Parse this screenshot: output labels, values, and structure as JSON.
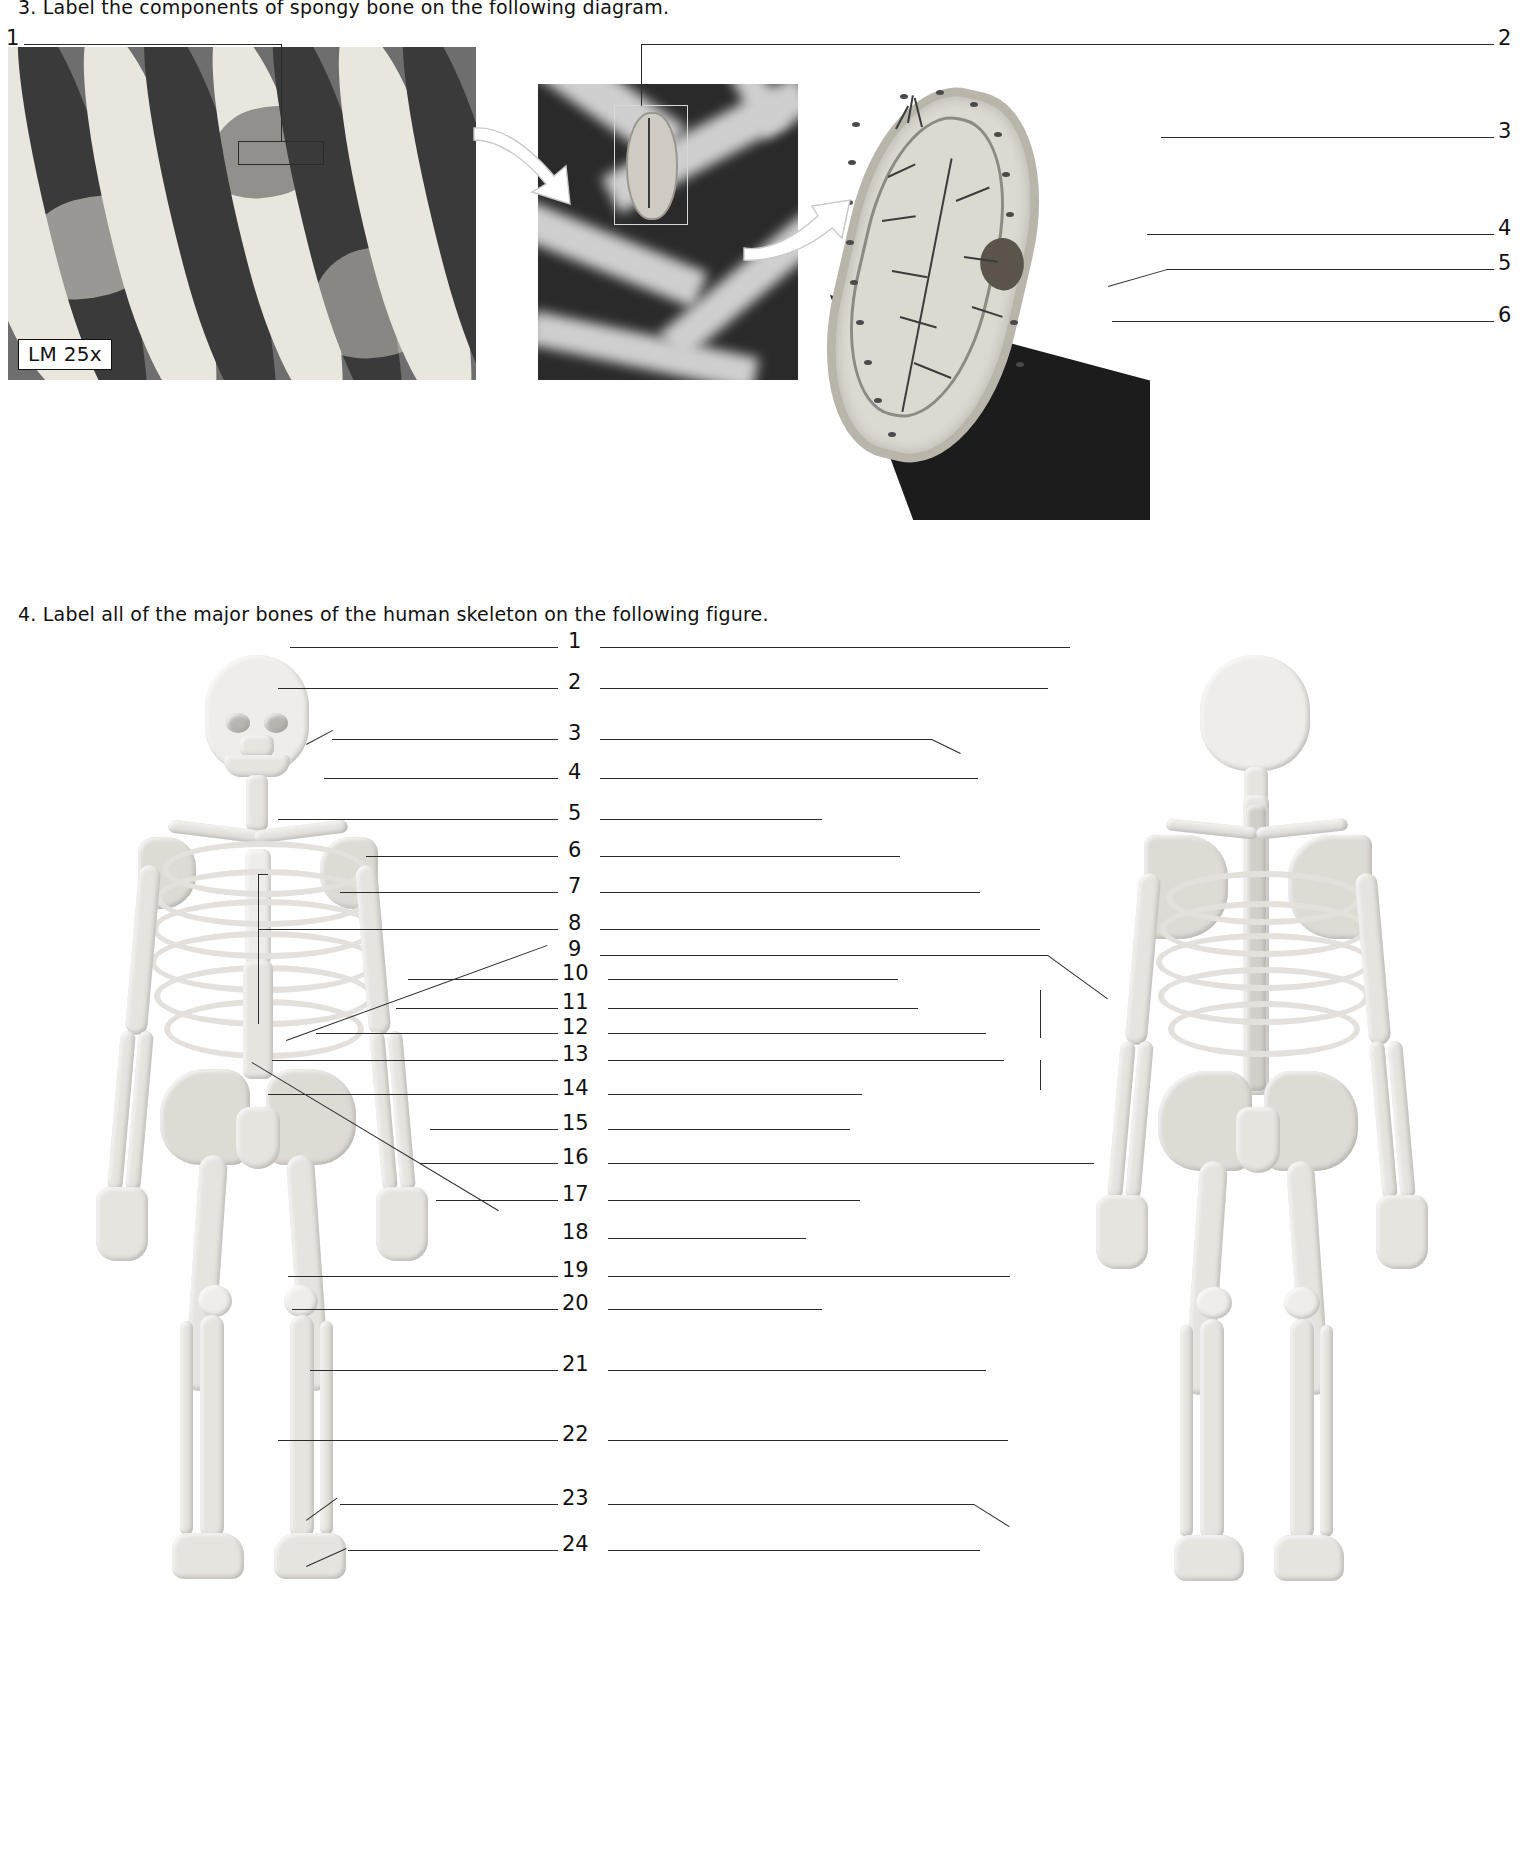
{
  "page": {
    "width": 1524,
    "height": 1858,
    "background": "#ffffff",
    "ink": "#1a1a1a"
  },
  "questions": [
    {
      "id": "q3",
      "number": "3.",
      "text": "3. Label the components of spongy bone on the following diagram.",
      "figure": "spongy-bone-trabecula",
      "micrograph_badge": "LM 25x",
      "blank_labels": [
        "1",
        "2",
        "3",
        "4",
        "5",
        "6"
      ]
    },
    {
      "id": "q4",
      "number": "4.",
      "text": "4. Label all of the major bones of the human skeleton on the following figure.",
      "figure": "human-skeleton-anterior-posterior",
      "blank_labels": [
        "1",
        "2",
        "3",
        "4",
        "5",
        "6",
        "7",
        "8",
        "9",
        "10",
        "11",
        "12",
        "13",
        "14",
        "15",
        "16",
        "17",
        "18",
        "19",
        "20",
        "21",
        "22",
        "23",
        "24"
      ]
    }
  ],
  "q3_labels": [
    {
      "n": "1",
      "side": "left",
      "x": 8,
      "y": 33
    },
    {
      "n": "2",
      "side": "right",
      "x": 1500,
      "y": 33
    },
    {
      "n": "3",
      "side": "right",
      "x": 1500,
      "y": 126
    },
    {
      "n": "4",
      "side": "right",
      "x": 1500,
      "y": 223
    },
    {
      "n": "5",
      "side": "right",
      "x": 1500,
      "y": 258
    },
    {
      "n": "6",
      "side": "right",
      "x": 1500,
      "y": 310
    }
  ],
  "q4_labels": [
    {
      "n": "1",
      "y": 639
    },
    {
      "n": "2",
      "y": 680
    },
    {
      "n": "3",
      "y": 731
    },
    {
      "n": "4",
      "y": 770
    },
    {
      "n": "5",
      "y": 811
    },
    {
      "n": "6",
      "y": 848
    },
    {
      "n": "7",
      "y": 884
    },
    {
      "n": "8",
      "y": 921
    },
    {
      "n": "9",
      "y": 947
    },
    {
      "n": "10",
      "y": 971
    },
    {
      "n": "11",
      "y": 1000
    },
    {
      "n": "12",
      "y": 1025
    },
    {
      "n": "13",
      "y": 1052
    },
    {
      "n": "14",
      "y": 1086
    },
    {
      "n": "15",
      "y": 1121
    },
    {
      "n": "16",
      "y": 1155
    },
    {
      "n": "17",
      "y": 1192
    },
    {
      "n": "18",
      "y": 1230
    },
    {
      "n": "19",
      "y": 1268
    },
    {
      "n": "20",
      "y": 1301
    },
    {
      "n": "21",
      "y": 1362
    },
    {
      "n": "22",
      "y": 1432
    },
    {
      "n": "23",
      "y": 1496
    },
    {
      "n": "24",
      "y": 1542
    }
  ],
  "figures": {
    "micrograph": {
      "name": "spongy-bone-light-micrograph",
      "badge": "LM 25x"
    },
    "sem_photo": {
      "name": "trabecula-sem-photo"
    },
    "trabecula_diagram": {
      "name": "trabecula-osteocyte-diagram"
    },
    "skeleton_anterior": {
      "name": "skeleton-anterior-view"
    },
    "skeleton_posterior": {
      "name": "skeleton-posterior-view"
    }
  },
  "colors": {
    "line": "#2b2b2b",
    "bone": "#e6e4df",
    "dark_photo": "#2a2a2a",
    "badge_bg": "#ffffff"
  }
}
